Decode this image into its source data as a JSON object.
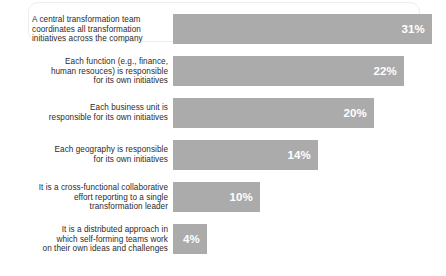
{
  "chart_data": {
    "type": "bar",
    "orientation": "horizontal",
    "title": "",
    "subtitle": "",
    "xlabel": "",
    "ylabel": "",
    "grid": false,
    "legend": false,
    "value_suffix": "%",
    "xlim": [
      0,
      31
    ],
    "bar_color": "#ababab",
    "value_label_color": "#ffffff",
    "label_color": "#2b2b2b",
    "categories": [
      "A central transformation team\ncoordinates all transformation\ninitiatives across the company",
      "Each function (e.g., finance,\nhuman resouces) is responsible\nfor its own initiatives",
      "Each business unit is\nresponsible for its own initiatives",
      "Each geography is responsible\nfor its own initiatives",
      "It is a cross-functional collaborative\neffort reporting to a single\ntransformation leader",
      "It is a distributed approach in\nwhich self-forming teams work\non their own ideas and challenges"
    ],
    "values": [
      31,
      22,
      20,
      14,
      10,
      4
    ],
    "value_labels": [
      "31%",
      "22%",
      "20%",
      "14%",
      "10%",
      "4%"
    ],
    "bar_pixel_widths": [
      259,
      231,
      201,
      145,
      87,
      34
    ]
  }
}
